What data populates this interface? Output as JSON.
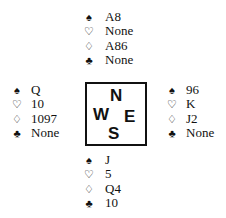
{
  "suits": {
    "spades": "♠",
    "hearts": "♡",
    "diamonds": "♢",
    "clubs": "♣"
  },
  "compass": {
    "north": "N",
    "south": "S",
    "east": "E",
    "west": "W"
  },
  "hands": {
    "north": {
      "spades": "A8",
      "hearts": "None",
      "diamonds": "A86",
      "clubs": "None"
    },
    "west": {
      "spades": "Q",
      "hearts": "10",
      "diamonds": "1097",
      "clubs": "None"
    },
    "east": {
      "spades": "96",
      "hearts": "K",
      "diamonds": "J2",
      "clubs": "None"
    },
    "south": {
      "spades": "J",
      "hearts": "5",
      "diamonds": "Q4",
      "clubs": "10"
    }
  }
}
